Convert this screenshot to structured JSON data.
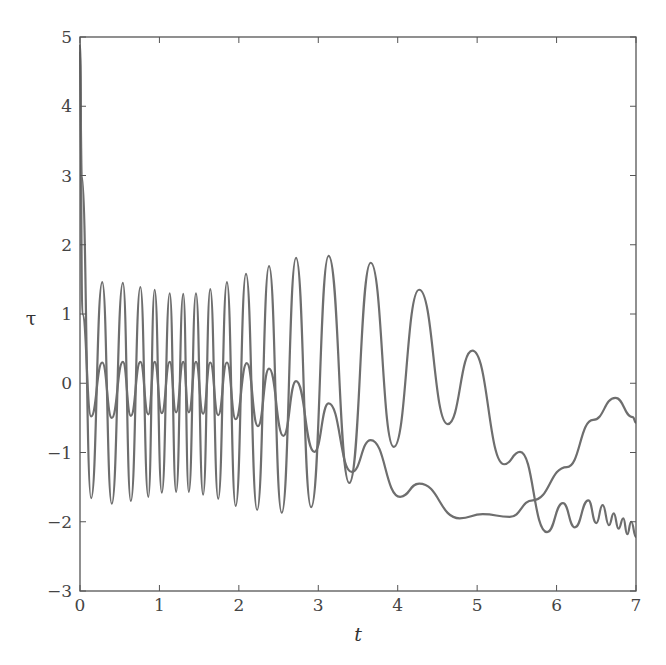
{
  "chart_data": {
    "type": "line",
    "title": "",
    "xlabel": "t",
    "ylabel": "τ",
    "xlim": [
      0,
      7
    ],
    "ylim": [
      -3,
      5
    ],
    "xticks": [
      "0",
      "1",
      "2",
      "3",
      "4",
      "5",
      "6",
      "7"
    ],
    "yticks": [
      "5",
      "4",
      "3",
      "2",
      "1",
      "0",
      "−1",
      "−2",
      "−3"
    ],
    "grid": false,
    "legend": null,
    "line_color": "#6e6e6e",
    "series": [
      {
        "name": "large-oscillation",
        "x": [
          0.0,
          0.02,
          0.14,
          0.28,
          0.4,
          0.54,
          0.64,
          0.76,
          0.86,
          0.94,
          1.03,
          1.13,
          1.21,
          1.3,
          1.37,
          1.46,
          1.55,
          1.64,
          1.74,
          1.85,
          1.96,
          2.09,
          2.23,
          2.38,
          2.54,
          2.72,
          2.91,
          3.13,
          3.39,
          3.66,
          3.95,
          4.27,
          4.63,
          4.94,
          5.34,
          5.54,
          5.88,
          6.08,
          6.23,
          6.4,
          6.5,
          6.58,
          6.66,
          6.72,
          6.78,
          6.84,
          6.89,
          6.94,
          7.0
        ],
        "y": [
          4.9,
          3.0,
          -1.66,
          1.46,
          -1.74,
          1.45,
          -1.7,
          1.39,
          -1.64,
          1.35,
          -1.58,
          1.3,
          -1.57,
          1.29,
          -1.57,
          1.3,
          -1.61,
          1.36,
          -1.67,
          1.46,
          -1.77,
          1.58,
          -1.83,
          1.69,
          -1.87,
          1.81,
          -1.79,
          1.84,
          -1.44,
          1.74,
          -0.92,
          1.35,
          -0.59,
          0.47,
          -1.17,
          -0.99,
          -2.15,
          -1.73,
          -2.08,
          -1.69,
          -2.02,
          -1.76,
          -2.05,
          -1.88,
          -2.1,
          -1.95,
          -2.18,
          -2.0,
          -2.22
        ]
      },
      {
        "name": "small-oscillation",
        "x": [
          0.0,
          0.03,
          0.14,
          0.28,
          0.4,
          0.54,
          0.64,
          0.76,
          0.86,
          0.94,
          1.03,
          1.13,
          1.21,
          1.3,
          1.37,
          1.46,
          1.55,
          1.64,
          1.74,
          1.85,
          1.96,
          2.1,
          2.24,
          2.38,
          2.56,
          2.72,
          2.95,
          3.13,
          3.42,
          3.66,
          4.03,
          4.27,
          4.78,
          5.07,
          5.41,
          5.7,
          6.13,
          6.46,
          6.74,
          6.96,
          7.0
        ],
        "y": [
          4.8,
          1.0,
          -0.48,
          0.3,
          -0.5,
          0.31,
          -0.47,
          0.31,
          -0.45,
          0.31,
          -0.43,
          0.31,
          -0.42,
          0.31,
          -0.42,
          0.31,
          -0.44,
          0.3,
          -0.46,
          0.3,
          -0.52,
          0.29,
          -0.62,
          0.21,
          -0.76,
          0.03,
          -0.99,
          -0.29,
          -1.28,
          -0.82,
          -1.64,
          -1.45,
          -1.95,
          -1.89,
          -1.93,
          -1.69,
          -1.21,
          -0.53,
          -0.21,
          -0.49,
          -0.57
        ]
      }
    ]
  }
}
